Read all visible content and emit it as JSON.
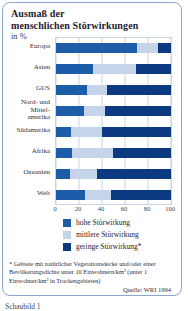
{
  "header": {
    "title_line1": "Ausmaß der",
    "title_line2": "menschlichen Störwirkungen",
    "subtitle": "in %"
  },
  "footnote": {
    "text": "* Gebiete mit natürlicher Vegetationsdecke und/oder einer Bevölkerungsdichte unter 10 Einwohnern/km² (unter 1 Einwohner/km² in Trockengebieten)"
  },
  "source": {
    "text": "Quelle: WRI 1994"
  },
  "caption": {
    "text": "Schaubild 1"
  },
  "colors": {
    "high": "#1d5ca8",
    "medium": "#c5d4e8",
    "low": "#0c3a80",
    "card_border": "#8ba5cb",
    "grid": "#c7d3e6"
  },
  "chart_data": {
    "type": "bar",
    "orientation": "horizontal",
    "stacked": true,
    "title": "Ausmaß der menschlichen Störwirkungen",
    "subtitle": "in %",
    "unit": "%",
    "categories": [
      "Europa",
      "Asien",
      "GUS",
      "Nord- und Mittelamerika",
      "Südamerika",
      "Afrika",
      "Ozeanien",
      "Welt"
    ],
    "category_display": [
      "Europa",
      "Asien",
      "GUS",
      "Nord- und\nMittel-\namerika",
      "Südamerika",
      "Afrika",
      "Ozeanien",
      "Welt"
    ],
    "series": [
      {
        "name": "hohe Störwirkung",
        "legend_label": "hohe Störwirkung",
        "color": "#1d5ca8",
        "values": [
          70,
          32,
          27,
          24,
          13,
          14,
          12,
          25
        ]
      },
      {
        "name": "mittlere Störwirkung",
        "legend_label": "mittlere Störwirkung",
        "color": "#c5d4e8",
        "values": [
          19,
          38,
          17,
          19,
          27,
          36,
          24,
          23
        ]
      },
      {
        "name": "geringe Störwirkung",
        "legend_label": "geringe Störwirkung*",
        "color": "#0c3a80",
        "values": [
          11,
          30,
          56,
          57,
          60,
          50,
          64,
          52
        ]
      }
    ],
    "xlim": [
      0,
      100
    ],
    "xticks": [
      0,
      20,
      40,
      60,
      80,
      100
    ],
    "grid": true,
    "legend_position": "bottom",
    "footnote": "* Gebiete mit natürlicher Vegetationsdecke und/oder einer Bevölkerungsdichte unter 10 Einwohnern/km² (unter 1 Einwohner/km² in Trockengebieten)",
    "source": "Quelle: WRI 1994"
  }
}
